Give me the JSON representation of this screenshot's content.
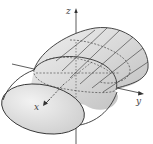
{
  "figure": {
    "type": "elliptic-cylinder-3d",
    "axes": {
      "x_label": "x",
      "y_label": "y",
      "z_label": "z"
    },
    "colors": {
      "surface_fill": "#d6d6d6",
      "surface_light": "#ececec",
      "end_cap_fill": "#e4e4e4",
      "outline": "#333333",
      "axis": "#333333",
      "dashed": "#444444"
    }
  }
}
